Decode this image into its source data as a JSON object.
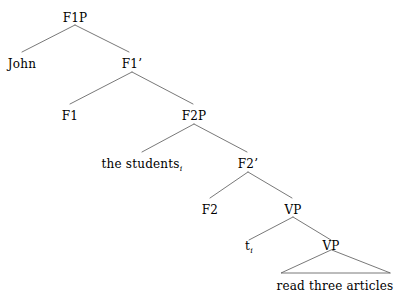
{
  "figure": {
    "type": "syntax-tree",
    "line_color": "#555555",
    "text_color": "#000000",
    "background_color": "#ffffff"
  },
  "nodes": {
    "f1p": "F1P",
    "john": "John",
    "f1bar": "F1’",
    "f1": "F1",
    "f2p": "F2P",
    "the_students": "the students",
    "the_students_sub": "i",
    "f2bar": "F2’",
    "f2": "F2",
    "vp_upper": "VP",
    "trace": "t",
    "trace_sub": "i",
    "vp_lower": "VP",
    "terminal_phrase": "read three articles"
  }
}
